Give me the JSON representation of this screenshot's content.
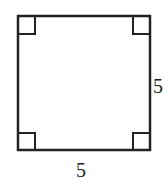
{
  "diagram": {
    "shape": "square",
    "right_angle_markers": 4,
    "labels": {
      "right_side": "5",
      "bottom_side": "5"
    },
    "stroke_color": "#222222"
  }
}
